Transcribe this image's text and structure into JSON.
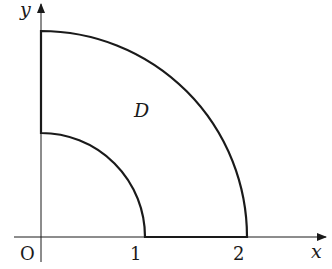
{
  "diagram": {
    "axes": {
      "x_label": "x",
      "y_label": "y",
      "origin_label": "O"
    },
    "ticks": {
      "x": [
        "1",
        "2"
      ]
    },
    "region_label": "D",
    "colors": {
      "stroke": "#1a1a1a",
      "background": "#ffffff"
    }
  }
}
